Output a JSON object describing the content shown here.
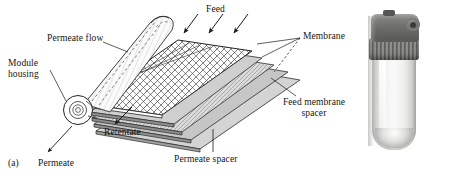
{
  "figure": {
    "caption_tags": {
      "a": "(a)",
      "b": "(b)"
    },
    "panel_a": {
      "name": "spiral-wound-membrane-module-diagram",
      "labels": {
        "feed": "Feed",
        "permeate_flow": "Permeate flow",
        "module_housing_line1": "Module",
        "module_housing_line2": "housing",
        "retentate": "Retentate",
        "permeate": "Permeate",
        "permeate_spacer": "Permeate spacer",
        "membrane": "Membrane",
        "feed_membrane_spacer_line1": "Feed membrane",
        "feed_membrane_spacer_line2": "spacer"
      },
      "icons": {
        "feed_arrows": "down-left-arrow-icon",
        "retentate_arrow": "down-left-arrow-icon",
        "permeate_arrow": "down-left-arrow-icon"
      }
    },
    "panel_b": {
      "name": "filter-housing-photo",
      "parts": {
        "cap": "cap",
        "collar": "threaded-collar",
        "bowl": "clear-bowl",
        "port": "inlet-outlet-port"
      }
    },
    "colors": {
      "background": "#ffffff",
      "ink": "#141414",
      "spacer_fill": "#b9b9b9",
      "membrane_fill": "#dcdcdc",
      "cap_dark": "#6f6f6d"
    }
  }
}
